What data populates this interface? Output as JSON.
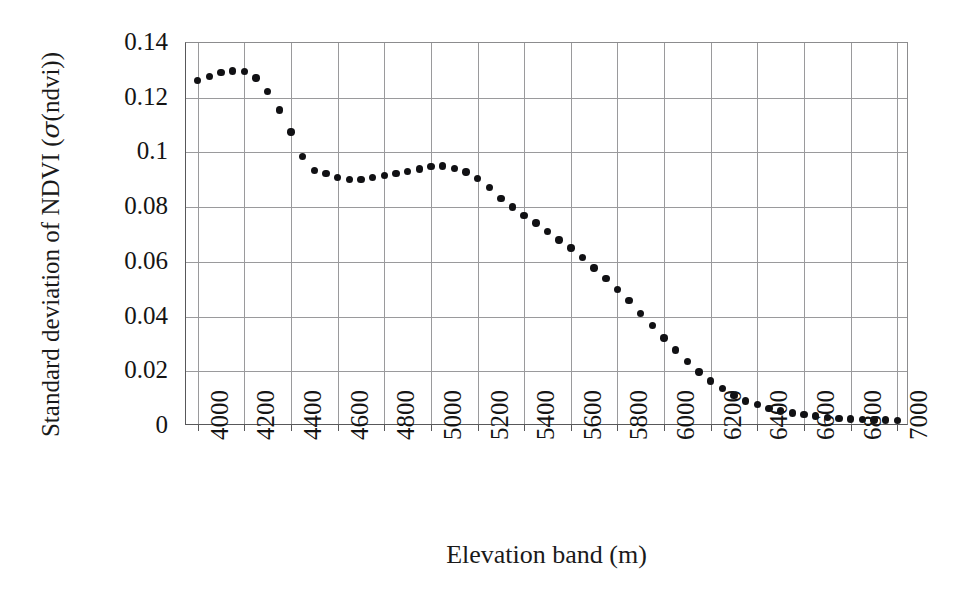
{
  "chart_data": {
    "type": "scatter",
    "title": "",
    "xlabel": "Elevation band (m)",
    "ylabel": "Standard deviation of NDVI (σ(ndvi))",
    "xlim": [
      3950,
      7050
    ],
    "ylim": [
      0,
      0.14
    ],
    "grid": true,
    "legend": null,
    "xtick_labels": [
      "4000",
      "4200",
      "4400",
      "4600",
      "4800",
      "5000",
      "5200",
      "5400",
      "5600",
      "5800",
      "6000",
      "6200",
      "6400",
      "6600",
      "6800",
      "7000"
    ],
    "xtick_values": [
      4000,
      4200,
      4400,
      4600,
      4800,
      5000,
      5200,
      5400,
      5600,
      5800,
      6000,
      6200,
      6400,
      6600,
      6800,
      7000
    ],
    "ytick_labels": [
      "0.14",
      "0.12",
      "0.1",
      "0.08",
      "0.06",
      "0.04",
      "0.02",
      "0"
    ],
    "ytick_values": [
      0.14,
      0.12,
      0.1,
      0.08,
      0.06,
      0.04,
      0.02,
      0
    ],
    "marker": "filled-circle",
    "marker_color": "#111114",
    "x": [
      4000,
      4050,
      4100,
      4150,
      4200,
      4250,
      4300,
      4350,
      4400,
      4450,
      4500,
      4550,
      4600,
      4650,
      4700,
      4750,
      4800,
      4850,
      4900,
      4950,
      5000,
      5050,
      5100,
      5150,
      5200,
      5250,
      5300,
      5350,
      5400,
      5450,
      5500,
      5550,
      5600,
      5650,
      5700,
      5750,
      5800,
      5850,
      5900,
      5950,
      6000,
      6050,
      6100,
      6150,
      6200,
      6250,
      6300,
      6350,
      6400,
      6450,
      6500,
      6550,
      6600,
      6650,
      6700,
      6750,
      6800,
      6850,
      6900,
      6950,
      7000
    ],
    "y": [
      0.1262,
      0.1278,
      0.1292,
      0.1298,
      0.1295,
      0.1272,
      0.1222,
      0.1155,
      0.1075,
      0.0985,
      0.0935,
      0.0922,
      0.0908,
      0.0902,
      0.0902,
      0.0908,
      0.0915,
      0.0922,
      0.093,
      0.094,
      0.0948,
      0.095,
      0.0942,
      0.0928,
      0.0905,
      0.0872,
      0.0832,
      0.08,
      0.077,
      0.0742,
      0.0712,
      0.068,
      0.065,
      0.0615,
      0.0578,
      0.054,
      0.05,
      0.0458,
      0.0412,
      0.0368,
      0.0322,
      0.0278,
      0.0235,
      0.0198,
      0.0165,
      0.0138,
      0.0112,
      0.0092,
      0.0078,
      0.0065,
      0.0055,
      0.0048,
      0.0042,
      0.0036,
      0.0032,
      0.0028,
      0.0026,
      0.0024,
      0.0022,
      0.0022,
      0.0021
    ]
  },
  "axis": {
    "y_title": "Standard deviation of NDVI (σ(ndvi))",
    "y_title_prefix": "Standard deviation of NDVI (",
    "y_title_sigma": "σ",
    "y_title_suffix": "(ndvi))",
    "x_title": "Elevation band (m)"
  }
}
